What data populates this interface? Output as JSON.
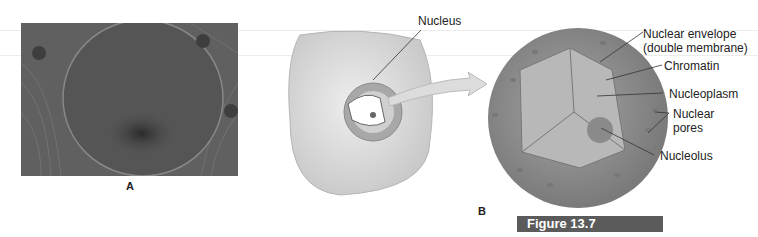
{
  "figure": {
    "caption": "Figure 13.7",
    "caption_bg": "#5b5b5b",
    "panel_a_label": "A",
    "panel_b_label": "B"
  },
  "labels": {
    "nucleus": "Nucleus",
    "nuclear_envelope_1": "Nuclear envelope",
    "nuclear_envelope_2": "(double membrane)",
    "chromatin": "Chromatin",
    "nucleoplasm": "Nucleoplasm",
    "nuclear_pores_1": "Nuclear",
    "nuclear_pores_2": "pores",
    "nucleolus": "Nucleolus"
  },
  "colors": {
    "cell_fill": "#d9d9d9",
    "sphere_fill": "#8c8c8c",
    "interior_fill": "#b5b5b5"
  }
}
